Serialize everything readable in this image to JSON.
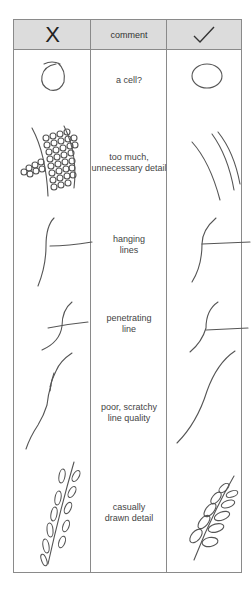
{
  "table": {
    "header": {
      "bad_label": "X",
      "comment_label": "comment",
      "good_label": "✓"
    },
    "rows": [
      {
        "comment": "a cell?",
        "bad_icon": "scribbled-circle",
        "good_icon": "clean-circle"
      },
      {
        "comment": "too much,\nunnecessary detail",
        "bad_icon": "cell-mesh-detail",
        "good_icon": "simple-curved-lines"
      },
      {
        "comment": "hanging\nlines",
        "bad_icon": "hanging-lines",
        "good_icon": "joined-lines"
      },
      {
        "comment": "penetrating\nline",
        "bad_icon": "crossing-line",
        "good_icon": "meeting-line"
      },
      {
        "comment": "poor, scratchy\nline quality",
        "bad_icon": "scratchy-line",
        "good_icon": "smooth-line"
      },
      {
        "comment": "casually\ndrawn detail",
        "bad_icon": "casual-leaf-sprig",
        "good_icon": "careful-leaf-sprig"
      }
    ]
  },
  "colors": {
    "header_bg": "#dcdcdc",
    "border": "#8a8a8a",
    "stroke": "#555555"
  }
}
